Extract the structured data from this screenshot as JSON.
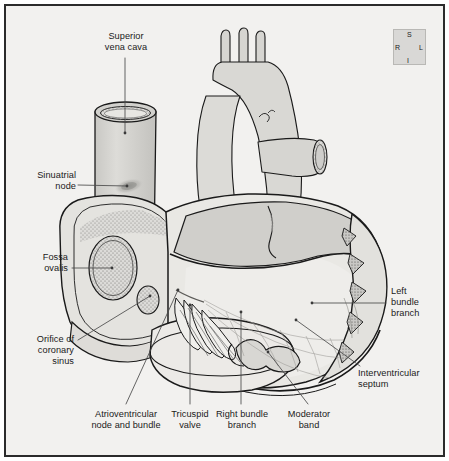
{
  "figure": {
    "background_color": "#f2f1ef",
    "border_color": "#2b2b2b",
    "line_color": "#1a1a1a",
    "leader_color": "#4a4a4a"
  },
  "labels": [
    {
      "id": "superior-vena-cava",
      "text": "Superior\nvena cava",
      "align": "center"
    },
    {
      "id": "sinuatrial-node",
      "text": "Sinuatrial\nnode",
      "align": "right"
    },
    {
      "id": "fossa-ovalis",
      "text": "Fossa\novalis",
      "align": "right"
    },
    {
      "id": "orifice-coronary-sinus",
      "text": "Orifice of\ncoronary\nsinus",
      "align": "right"
    },
    {
      "id": "atrioventricular-node",
      "text": "Atrioventricular\nnode and bundle",
      "align": "center"
    },
    {
      "id": "tricuspid-valve",
      "text": "Tricuspid\nvalve",
      "align": "center"
    },
    {
      "id": "right-bundle-branch",
      "text": "Right bundle\nbranch",
      "align": "center"
    },
    {
      "id": "moderator-band",
      "text": "Moderator\nband",
      "align": "center"
    },
    {
      "id": "left-bundle-branch",
      "text": "Left\nbundle\nbranch",
      "align": "left"
    },
    {
      "id": "interventricular-septum",
      "text": "Interventricular\nseptum",
      "align": "left"
    }
  ],
  "compass": {
    "superior": "S",
    "inferior": "I",
    "right": "R",
    "left": "L",
    "box_color": "#d9d8d6"
  }
}
